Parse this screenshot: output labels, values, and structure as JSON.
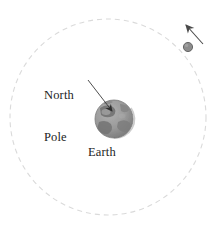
{
  "figure": {
    "background_color": "#ffffff",
    "width": 220,
    "height": 230
  },
  "labels": {
    "north_pole_line1": "North",
    "north_pole_line2": "Pole",
    "earth": "Earth"
  },
  "colors": {
    "text": "#1d1d1d",
    "orbit_dash": "#d8d8d8",
    "earth_base": "#9a9a9a",
    "earth_dark": "#6e6e6e",
    "earth_light": "#b4b4b4",
    "earth_rim": "#7a7a7a",
    "satellite_fill": "#8c8c8c",
    "satellite_rim": "#5e5e5e",
    "leader_line": "#3a3a3a",
    "motion_arrow": "#4a4a4a"
  },
  "geometry": {
    "orbit_center_x": 108,
    "orbit_center_y": 117,
    "orbit_radius": 98,
    "orbit_style": "dashed",
    "earth_center_x": 114,
    "earth_center_y": 119,
    "earth_radius": 19,
    "satellite_center_x": 188,
    "satellite_center_y": 47,
    "satellite_radius": 4.6,
    "leader_from_x": 88,
    "leader_from_y": 80,
    "leader_to_x": 112,
    "leader_to_y": 111,
    "motion_arrow_from_x": 203,
    "motion_arrow_from_y": 44,
    "motion_arrow_to_x": 186,
    "motion_arrow_to_y": 25
  },
  "elements": {
    "orbit_name": "orbit-path",
    "earth_name": "earth-sphere",
    "satellite_name": "satellite-body",
    "leader_name": "north-pole-leader-line",
    "motion_arrow_name": "orbital-motion-arrow"
  }
}
